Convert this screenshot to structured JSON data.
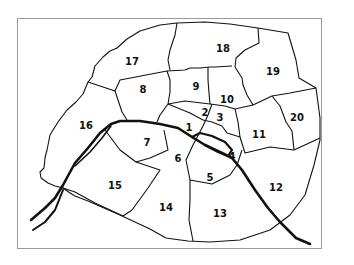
{
  "map": {
    "subject": "Paris arrondissements",
    "colors": {
      "border": "#111111",
      "river": "#111111",
      "frame": "#9a9a9a",
      "background": "#ffffff"
    },
    "labels": [
      {
        "id": "1",
        "text": "1",
        "x": 189,
        "y": 127
      },
      {
        "id": "2",
        "text": "2",
        "x": 205,
        "y": 112
      },
      {
        "id": "3",
        "text": "3",
        "x": 220,
        "y": 117
      },
      {
        "id": "4",
        "text": "4",
        "x": 232,
        "y": 156
      },
      {
        "id": "5",
        "text": "5",
        "x": 210,
        "y": 177
      },
      {
        "id": "6",
        "text": "6",
        "x": 178,
        "y": 158
      },
      {
        "id": "7",
        "text": "7",
        "x": 147,
        "y": 142
      },
      {
        "id": "8",
        "text": "8",
        "x": 143,
        "y": 89
      },
      {
        "id": "9",
        "text": "9",
        "x": 196,
        "y": 86
      },
      {
        "id": "10",
        "text": "10",
        "x": 227,
        "y": 99
      },
      {
        "id": "11",
        "text": "11",
        "x": 259,
        "y": 134
      },
      {
        "id": "12",
        "text": "12",
        "x": 276,
        "y": 187
      },
      {
        "id": "13",
        "text": "13",
        "x": 220,
        "y": 213
      },
      {
        "id": "14",
        "text": "14",
        "x": 166,
        "y": 207
      },
      {
        "id": "15",
        "text": "15",
        "x": 115,
        "y": 185
      },
      {
        "id": "16",
        "text": "16",
        "x": 86,
        "y": 125
      },
      {
        "id": "17",
        "text": "17",
        "x": 132,
        "y": 61
      },
      {
        "id": "18",
        "text": "18",
        "x": 223,
        "y": 48
      },
      {
        "id": "19",
        "text": "19",
        "x": 273,
        "y": 71
      },
      {
        "id": "20",
        "text": "20",
        "x": 297,
        "y": 117
      }
    ]
  }
}
